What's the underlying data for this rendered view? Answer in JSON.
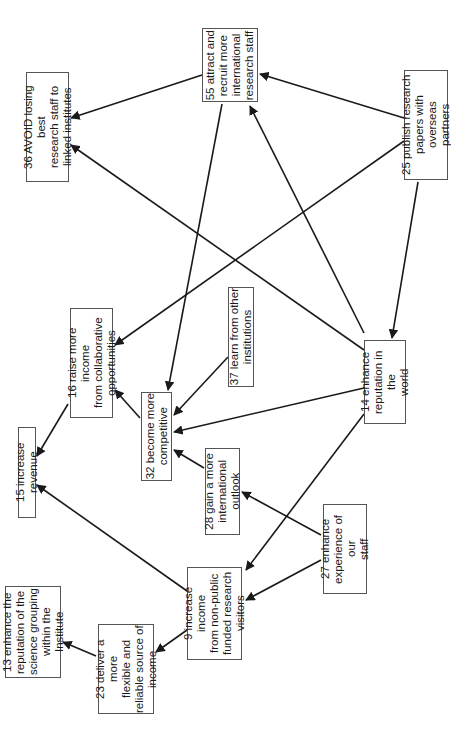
{
  "diagram": {
    "type": "cause-map",
    "orientation": "rotated-90-ccw",
    "nodes": [
      {
        "id": "36",
        "text": "36 AVOID losing best\nresearch staff to\nlinked institutes",
        "box": [
          26,
          72,
          43,
          110
        ]
      },
      {
        "id": "55",
        "text": "55 attract and\nrecruit more\ninternational\nresearch staff",
        "box": [
          202,
          28,
          56,
          74
        ]
      },
      {
        "id": "25",
        "text": "25 publish research\npapers with overseas\npartners",
        "box": [
          404,
          70,
          44,
          110
        ]
      },
      {
        "id": "16",
        "text": "16 raise more income\nfrom collaborative\nopportunities",
        "box": [
          70,
          308,
          43,
          110
        ]
      },
      {
        "id": "37",
        "text": "37 learn from other\ninstitutions",
        "box": [
          228,
          287,
          26,
          100
        ]
      },
      {
        "id": "32",
        "text": "32 become more\ncompetitive",
        "box": [
          141,
          392,
          31,
          89
        ]
      },
      {
        "id": "14",
        "text": "14 enhance\nreputation in the\nworld",
        "box": [
          364,
          340,
          42,
          84
        ]
      },
      {
        "id": "15",
        "text": "15 increase revenue",
        "box": [
          18,
          427,
          18,
          91
        ]
      },
      {
        "id": "28",
        "text": "28 gain a more\ninternational\noutlook",
        "box": [
          205,
          448,
          35,
          87
        ]
      },
      {
        "id": "27",
        "text": "27 enhance\nexperience of our\nstaff",
        "box": [
          323,
          504,
          44,
          90
        ]
      },
      {
        "id": "9",
        "text": "9 increase income\nfrom non-public\nfunded research\nvisitors",
        "box": [
          187,
          567,
          55,
          93
        ]
      },
      {
        "id": "23",
        "text": "23 deliver a more\nflexible and\nreliable source of\nincome",
        "box": [
          98,
          624,
          56,
          90
        ]
      },
      {
        "id": "13",
        "text": "13 enhance the\nreputation of the\nscience grouping\nwithin the Institute",
        "box": [
          5,
          586,
          56,
          92
        ]
      }
    ],
    "edges": [
      {
        "from": "55",
        "to": "36",
        "pts": [
          202,
          75,
          71,
          118
        ]
      },
      {
        "from": "14",
        "to": "36",
        "pts": [
          364,
          350,
          71,
          145
        ]
      },
      {
        "from": "25",
        "to": "55",
        "pts": [
          404,
          118,
          260,
          74
        ]
      },
      {
        "from": "14",
        "to": "55",
        "pts": [
          364,
          333,
          250,
          106
        ]
      },
      {
        "from": "25",
        "to": "16",
        "pts": [
          404,
          141,
          115,
          345
        ]
      },
      {
        "from": "55",
        "to": "32",
        "pts": [
          222,
          104,
          168,
          390
        ]
      },
      {
        "from": "25",
        "to": "14",
        "pts": [
          418,
          182,
          392,
          338
        ]
      },
      {
        "from": "37",
        "to": "32",
        "pts": [
          228,
          357,
          174,
          415
        ]
      },
      {
        "from": "14",
        "to": "32",
        "pts": [
          364,
          388,
          174,
          432
        ]
      },
      {
        "from": "28",
        "to": "32",
        "pts": [
          204,
          468,
          174,
          450
        ]
      },
      {
        "from": "32",
        "to": "16",
        "pts": [
          140,
          418,
          115,
          390
        ]
      },
      {
        "from": "16",
        "to": "15",
        "pts": [
          68,
          404,
          37,
          456
        ]
      },
      {
        "from": "14",
        "to": "9",
        "pts": [
          364,
          414,
          246,
          570
        ]
      },
      {
        "from": "27",
        "to": "28",
        "pts": [
          321,
          535,
          242,
          492
        ]
      },
      {
        "from": "27",
        "to": "9",
        "pts": [
          321,
          560,
          246,
          600
        ]
      },
      {
        "from": "9",
        "to": "15",
        "pts": [
          187,
          591,
          37,
          485
        ]
      },
      {
        "from": "9",
        "to": "23",
        "pts": [
          187,
          630,
          156,
          652
        ]
      },
      {
        "from": "23",
        "to": "13",
        "pts": [
          96,
          656,
          63,
          642
        ]
      }
    ]
  },
  "style": {
    "line": "#1a1a1a",
    "border": "#555555",
    "bg": "#ffffff"
  }
}
